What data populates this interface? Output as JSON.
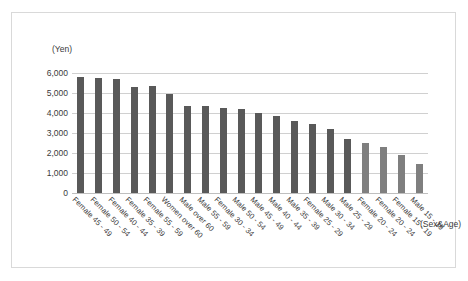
{
  "chart_data": {
    "type": "bar",
    "title": "",
    "subtitle": "",
    "xlabel": "(Sex&Age)",
    "ylabel": "(Yen)",
    "ylim": [
      0,
      6000
    ],
    "ytick_labels": [
      "6,000",
      "5,000",
      "4,000",
      "3,000",
      "2,000",
      "1,000",
      "0"
    ],
    "ytick_values": [
      6000,
      5000,
      4000,
      3000,
      2000,
      1000,
      0
    ],
    "grid": true,
    "legend": "none",
    "categories": [
      "Female 45 - 49",
      "Female 50 - 54",
      "Female 40 - 44",
      "Female 35 - 39",
      "Female 55 - 59",
      "Women over 60",
      "Male over 60",
      "Male 55 - 59",
      "Female 30 - 34",
      "Male 50 - 54",
      "Male 45 - 49",
      "Male 40 - 44",
      "Male 35 - 39",
      "Female 25 - 29",
      "Male 30 - 34",
      "Male 25 - 29",
      "Female 20 - 24",
      "Female 20 - 24",
      "Female 15 - 19",
      "Male 15 - 19"
    ],
    "values": [
      5800,
      5750,
      5700,
      5320,
      5330,
      4940,
      4370,
      4360,
      4240,
      4190,
      4010,
      3830,
      3600,
      3440,
      3220,
      2680,
      2510,
      2280,
      1900,
      1470
    ],
    "bar_colors": [
      "#595959",
      "#595959",
      "#595959",
      "#595959",
      "#595959",
      "#595959",
      "#595959",
      "#595959",
      "#595959",
      "#595959",
      "#595959",
      "#595959",
      "#595959",
      "#595959",
      "#595959",
      "#595959",
      "#7f7f7f",
      "#7f7f7f",
      "#7f7f7f",
      "#7f7f7f"
    ]
  },
  "colors": {
    "bar_dark": "#595959",
    "bar_light": "#7f7f7f",
    "gridline": "#d0d0d0",
    "frame_border": "#d9d9d9",
    "text": "#3a3a3a",
    "background": "#ffffff"
  }
}
